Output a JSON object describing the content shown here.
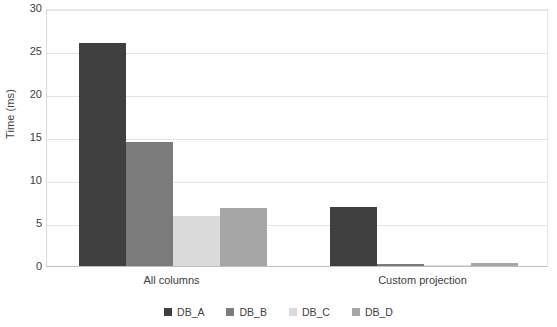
{
  "chart_data": {
    "type": "bar",
    "title": "",
    "xlabel": "",
    "ylabel": "Time (ms)",
    "categories": [
      "All columns",
      "Custom projection"
    ],
    "series": [
      {
        "name": "DB_A",
        "color": "#3f3f3f",
        "values": [
          25.9,
          6.9
        ]
      },
      {
        "name": "DB_B",
        "color": "#7b7b7b",
        "values": [
          14.4,
          0.2
        ]
      },
      {
        "name": "DB_C",
        "color": "#dadada",
        "values": [
          5.8,
          0.05
        ]
      },
      {
        "name": "DB_D",
        "color": "#a6a6a6",
        "values": [
          6.7,
          0.3
        ]
      }
    ],
    "ylim": [
      0,
      30
    ],
    "yticks": [
      0,
      5,
      10,
      15,
      20,
      25,
      30
    ],
    "ytick_labels": [
      "0",
      "5",
      "10",
      "15",
      "20",
      "25",
      "30"
    ],
    "grid": true,
    "legend_position": "bottom"
  },
  "axis": {
    "y_title": "Time (ms)"
  }
}
